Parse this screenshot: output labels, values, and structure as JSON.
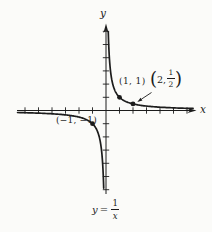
{
  "figure": {
    "background": "#fbfbf9",
    "ink": "#1c1c1c"
  },
  "chart_data": {
    "type": "line",
    "function": "y = 1/x",
    "xlabel": "x",
    "ylabel": "y",
    "grid": false,
    "x_axis_range_drawn": [
      -6.6,
      6.7
    ],
    "y_axis_range_drawn": [
      -6.3,
      6.5
    ],
    "x_ticks": [
      -6,
      -5,
      -4,
      -3,
      -2,
      -1,
      1,
      2,
      3,
      4,
      5,
      6
    ],
    "y_ticks": [
      -6,
      -5,
      -4,
      -3,
      -2,
      -1,
      1,
      2,
      3,
      4,
      5,
      6
    ],
    "branches": [
      {
        "quadrant": "I",
        "x_min": 0.168,
        "x_max": 6.45
      },
      {
        "quadrant": "III",
        "x_min": -6.55,
        "x_max": -0.17
      }
    ],
    "marked_points": [
      {
        "x": 1,
        "y": 1,
        "label": "(1, 1)"
      },
      {
        "x": 2,
        "y": 0.5,
        "label": "(2, 1/2)"
      },
      {
        "x": -1,
        "y": -1,
        "label": "(−1, −1)"
      }
    ]
  },
  "labels": {
    "point_1_1": "(1, 1)",
    "point_neg1_neg1": "(−1, −1)",
    "point_2_half": {
      "open": "(",
      "pre": "2,",
      "num": "1",
      "den": "2",
      "close": ")"
    },
    "equation": {
      "lhs": "y",
      "eq": "=",
      "num": "1",
      "den": "x"
    },
    "x_axis": "x",
    "y_axis": "y"
  }
}
